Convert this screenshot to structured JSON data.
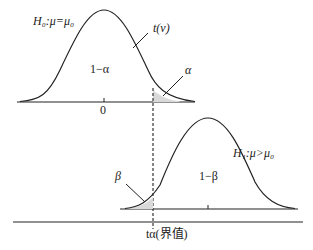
{
  "diagram": {
    "h0_label": "H₀:μ=μ₀",
    "h1_label": "H₁:μ>μ₀",
    "t_dist_label": "t(ν)",
    "one_minus_alpha": "1−α",
    "alpha": "α",
    "zero_tick": "0",
    "beta": "β",
    "one_minus_beta": "1−β",
    "critical_value_label": "tα(界值)",
    "colors": {
      "line": "#222222",
      "shade": "#d9d9d9"
    }
  }
}
